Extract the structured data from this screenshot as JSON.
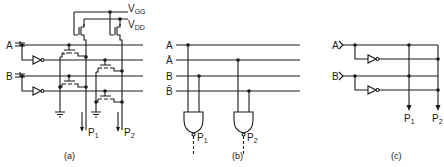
{
  "figure": {
    "panels": [
      {
        "id": "a",
        "caption": "(a)",
        "inputs": [
          "A",
          "B"
        ],
        "supplies": [
          {
            "label": "V",
            "sub": "GG"
          },
          {
            "label": "V",
            "sub": "DD"
          }
        ],
        "outputs": [
          {
            "label": "P",
            "sub": "1"
          },
          {
            "label": "P",
            "sub": "2"
          }
        ]
      },
      {
        "id": "b",
        "caption": "(b)",
        "lines": [
          "A",
          "Ā",
          "B",
          "B̄"
        ],
        "outputs": [
          {
            "label": "P",
            "sub": "1"
          },
          {
            "label": "P",
            "sub": "2"
          }
        ]
      },
      {
        "id": "c",
        "caption": "(c)",
        "inputs": [
          "A",
          "B"
        ],
        "outputs": [
          {
            "label": "P",
            "sub": "1"
          },
          {
            "label": "P",
            "sub": "2"
          }
        ]
      }
    ]
  }
}
